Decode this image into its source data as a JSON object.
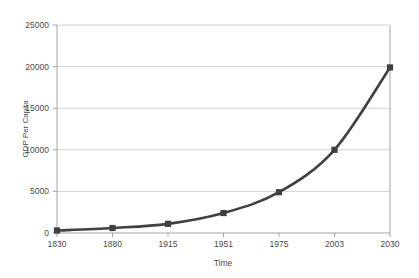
{
  "chart_data": {
    "type": "line",
    "title": "",
    "xlabel": "Time",
    "ylabel": "GDP Per Capita",
    "categories": [
      "1830",
      "1880",
      "1915",
      "1951",
      "1975",
      "2003",
      "2030"
    ],
    "series": [
      {
        "name": "GDP Per Capita",
        "values": [
          300,
          600,
          1100,
          2400,
          4900,
          10000,
          19900
        ],
        "color": "#404040",
        "marker": "square"
      }
    ],
    "ylim": [
      0,
      25000
    ],
    "yticks": [
      0,
      5000,
      10000,
      15000,
      20000,
      25000
    ],
    "ytick_labels": [
      "0",
      "5000",
      "10000",
      "15000",
      "20000",
      "25000"
    ],
    "grid": "horizontal",
    "legend": "none",
    "background": "#ffffff",
    "gridline_color": "#c8c8c8",
    "axis_color": "#9a9a9a",
    "text_color": "#4a4a4a"
  }
}
